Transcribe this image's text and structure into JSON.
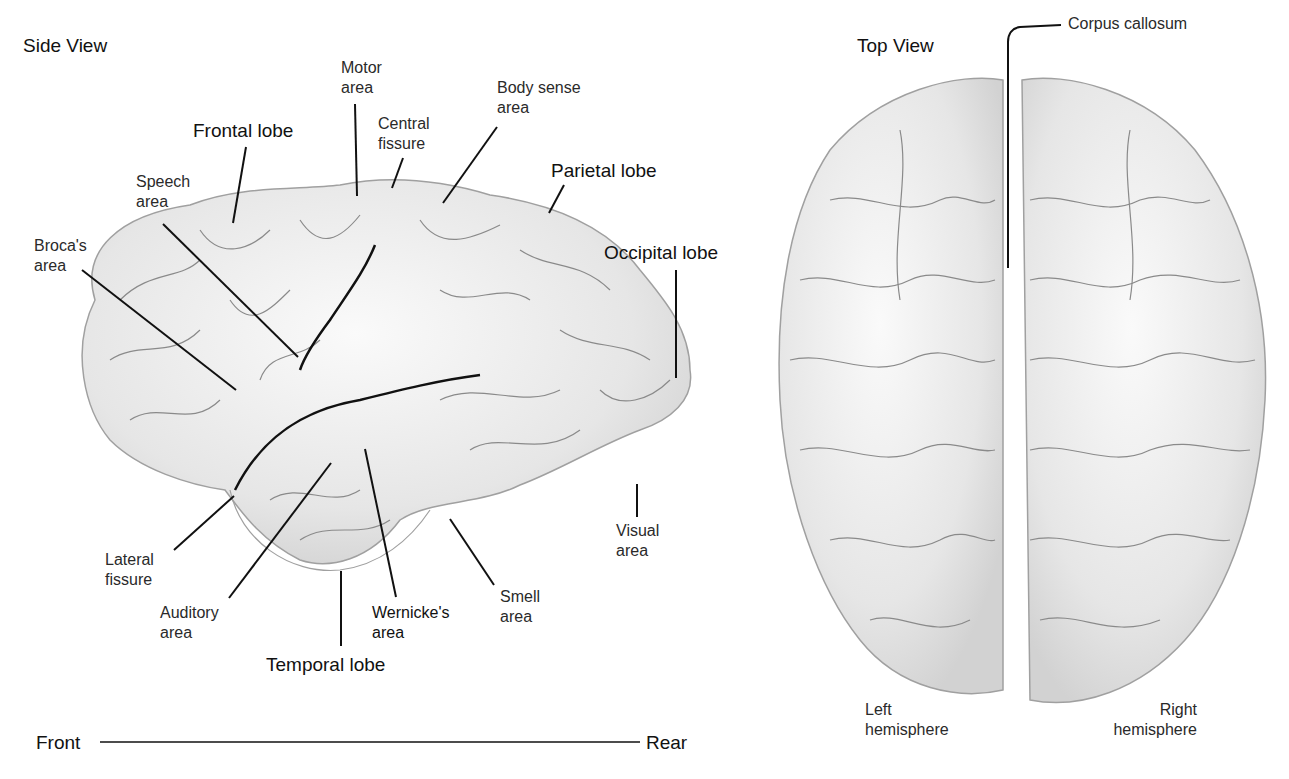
{
  "side_view": {
    "title": "Side View",
    "labels": {
      "motor_area": [
        "Motor",
        "area"
      ],
      "body_sense_area": [
        "Body sense",
        "area"
      ],
      "central_fissure": [
        "Central",
        "fissure"
      ],
      "frontal_lobe": "Frontal lobe",
      "parietal_lobe": "Parietal lobe",
      "speech_area": [
        "Speech",
        "area"
      ],
      "brocas_area": [
        "Broca's",
        "area"
      ],
      "occipital_lobe": "Occipital lobe",
      "lateral_fissure": [
        "Lateral",
        "fissure"
      ],
      "auditory_area": [
        "Auditory",
        "area"
      ],
      "wernickes_area": [
        "Wernicke's",
        "area"
      ],
      "smell_area": [
        "Smell",
        "area"
      ],
      "visual_area": [
        "Visual",
        "area"
      ],
      "temporal_lobe": "Temporal lobe"
    },
    "axis": {
      "front": "Front",
      "rear": "Rear"
    }
  },
  "top_view": {
    "title": "Top View",
    "labels": {
      "corpus_callosum": "Corpus callosum",
      "left_hemisphere": [
        "Left",
        "hemisphere"
      ],
      "right_hemisphere": [
        "Right",
        "hemisphere"
      ]
    }
  },
  "colors": {
    "brain_fill": "#ececec",
    "brain_shade": "#d4d4d4",
    "sulcus": "#8a8a8a",
    "leader": "#111111"
  }
}
